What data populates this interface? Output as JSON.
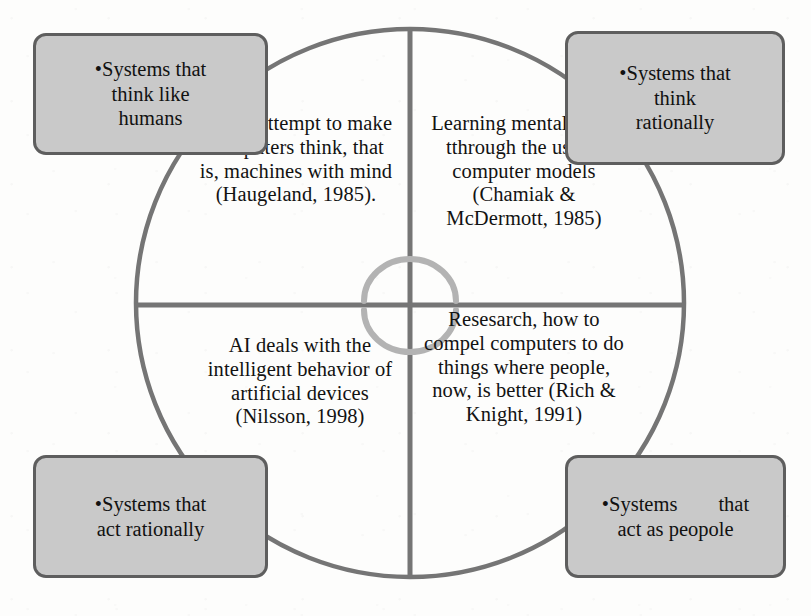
{
  "diagram": {
    "colors": {
      "circle_stroke": "#757575",
      "divider_stroke": "#757575",
      "arc_accent": "#b3b3b3",
      "box_fill": "#c9c9c9",
      "box_border": "#5e5e5e",
      "text": "#111111",
      "page_background": "#fdfdfc"
    },
    "geometry": {
      "circle_center_x": 410,
      "circle_center_y": 303,
      "circle_radius": 274,
      "vertical_divider_x": 410,
      "horizontal_divider_y": 305
    }
  },
  "quadrants": {
    "top_left": {
      "name": "think-like-humans",
      "text": "A new attempt to make computers think, that is, machines with mind (Haugeland, 1985)."
    },
    "top_right": {
      "name": "think-rationally",
      "text": "Learning mental skills tthrough the use of computer models (Chamiak & McDermott, 1985)"
    },
    "bottom_left": {
      "name": "act-rationally",
      "text": "AI deals with the intelligent behavior of artificial devices (Nilsson, 1998)"
    },
    "bottom_right": {
      "name": "act-as-people",
      "text": "Resesarch, how to compel computers to do things where people, now, is better (Rich & Knight, 1991)"
    }
  },
  "callouts": {
    "top_left": {
      "bullet": "•",
      "line1": "Systems that",
      "line2": "think like",
      "line3": "humans"
    },
    "top_right": {
      "bullet": "•",
      "line1": "Systems that",
      "line2": "think",
      "line3": "rationally"
    },
    "bottom_left": {
      "bullet": "•",
      "line1": "Systems that",
      "line2": "act rationally"
    },
    "bottom_right": {
      "bullet": "•",
      "line1": "Systems  that",
      "line2": "act as peopole"
    }
  },
  "center_arcs": {
    "upper": "upper-semicircle-arc",
    "lower": "lower-semicircle-arc"
  }
}
